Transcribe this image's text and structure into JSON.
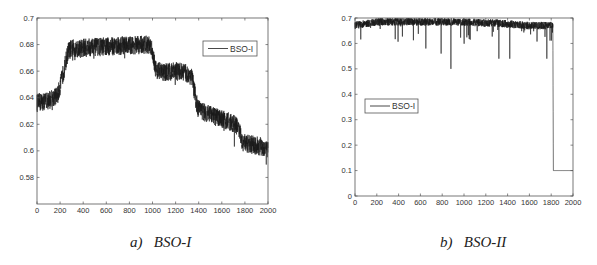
{
  "chart_data": [
    {
      "type": "line",
      "title": "",
      "caption": "a)   BSO-I",
      "xlabel": "",
      "ylabel": "",
      "xlim": [
        0,
        2000
      ],
      "ylim": [
        0.56,
        0.7
      ],
      "xticks": [
        0,
        200,
        400,
        600,
        800,
        1000,
        1200,
        1400,
        1600,
        1800,
        2000
      ],
      "yticks": [
        0.58,
        0.6,
        0.62,
        0.64,
        0.66,
        0.68,
        0.7
      ],
      "ytick_labels": [
        "0.58",
        "0.6",
        "0.62",
        "0.64",
        "0.66",
        "0.68",
        "0.7"
      ],
      "grid": false,
      "legend": {
        "entries": [
          "BSO-I"
        ],
        "position": "upper right"
      },
      "series": [
        {
          "name": "BSO-I",
          "trend_points": [
            [
              0,
              0.636
            ],
            [
              100,
              0.638
            ],
            [
              180,
              0.642
            ],
            [
              210,
              0.652
            ],
            [
              270,
              0.675
            ],
            [
              300,
              0.677
            ],
            [
              500,
              0.678
            ],
            [
              700,
              0.679
            ],
            [
              950,
              0.68
            ],
            [
              990,
              0.679
            ],
            [
              1030,
              0.661
            ],
            [
              1100,
              0.659
            ],
            [
              1250,
              0.66
            ],
            [
              1340,
              0.656
            ],
            [
              1390,
              0.632
            ],
            [
              1500,
              0.627
            ],
            [
              1700,
              0.621
            ],
            [
              1740,
              0.618
            ],
            [
              1780,
              0.606
            ],
            [
              1900,
              0.604
            ],
            [
              2000,
              0.602
            ]
          ],
          "noise_amplitude": 0.007
        }
      ]
    },
    {
      "type": "line",
      "title": "",
      "caption": "b)   BSO-II",
      "xlabel": "",
      "ylabel": "",
      "xlim": [
        0,
        2000
      ],
      "ylim": [
        0,
        0.7
      ],
      "xticks": [
        0,
        200,
        400,
        600,
        800,
        1000,
        1200,
        1400,
        1600,
        1800,
        2000
      ],
      "yticks": [
        0,
        0.1,
        0.2,
        0.3,
        0.4,
        0.5,
        0.6,
        0.7
      ],
      "ytick_labels": [
        "0",
        "0.1",
        "0.2",
        "0.3",
        "0.4",
        "0.5",
        "0.6",
        "0.7"
      ],
      "grid": false,
      "legend": {
        "entries": [
          "BSO-II"
        ],
        "position": "center left"
      },
      "series": [
        {
          "name": "BSO-II",
          "trend_points": [
            [
              0,
              0.66
            ],
            [
              50,
              0.665
            ],
            [
              200,
              0.675
            ],
            [
              800,
              0.675
            ],
            [
              1300,
              0.67
            ],
            [
              1600,
              0.66
            ],
            [
              1815,
              0.66
            ],
            [
              1820,
              0.1
            ],
            [
              2000,
              0.1
            ]
          ],
          "noise_amplitude": 0.03,
          "notable_dips": [
            [
              880,
              0.5
            ],
            [
              650,
              0.58
            ],
            [
              790,
              0.56
            ],
            [
              1320,
              0.54
            ],
            [
              1420,
              0.54
            ],
            [
              1760,
              0.54
            ]
          ]
        }
      ]
    }
  ],
  "captions": {
    "a": "a)   BSO-I",
    "b": "b)   BSO-II"
  },
  "legends": {
    "a": "BSO-I",
    "b": "BSO-I"
  },
  "colors": {
    "line": "#1a1a1a",
    "axis": "#555555",
    "text": "#333333"
  }
}
